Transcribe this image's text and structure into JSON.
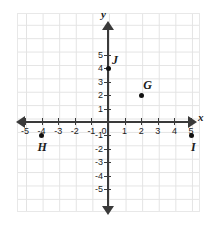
{
  "chart_data": {
    "type": "scatter",
    "title": "",
    "xlabel": "x",
    "ylabel": "y",
    "xlim": [
      -5.5,
      5.5
    ],
    "ylim": [
      -5.5,
      5.5
    ],
    "grid": true,
    "legend": "none",
    "x_ticks": [
      "-5",
      "-4",
      "-3",
      "-2",
      "-1",
      "0",
      "1",
      "2",
      "3",
      "4",
      "5"
    ],
    "y_ticks": [
      "5",
      "4",
      "3",
      "2",
      "1",
      "-1",
      "-2",
      "-3",
      "-4",
      "-5"
    ],
    "origin_label": "0",
    "points": [
      {
        "label": "G",
        "x": 2,
        "y": 2
      },
      {
        "label": "H",
        "x": -4,
        "y": -1
      },
      {
        "label": "I",
        "x": 5,
        "y": -1
      },
      {
        "label": "J",
        "x": 0,
        "y": 4
      }
    ],
    "colors": {
      "grid": "#e3e3e3",
      "axis": "#3a3a3a",
      "point": "#111111",
      "text": "#1b1b1b",
      "background": "#ffffff"
    }
  },
  "axes": {
    "x_name": "x",
    "y_name": "y"
  },
  "x_tick_labels": [
    {
      "text": "-5",
      "value": -5
    },
    {
      "text": "-4",
      "value": -4
    },
    {
      "text": "-3",
      "value": -3
    },
    {
      "text": "-2",
      "value": -2
    },
    {
      "text": "-1",
      "value": -1
    },
    {
      "text": "0",
      "value": 0
    },
    {
      "text": "1",
      "value": 1
    },
    {
      "text": "2",
      "value": 2
    },
    {
      "text": "3",
      "value": 3
    },
    {
      "text": "4",
      "value": 4
    },
    {
      "text": "5",
      "value": 5
    }
  ],
  "y_tick_labels": [
    {
      "text": "5",
      "value": 5
    },
    {
      "text": "4",
      "value": 4
    },
    {
      "text": "3",
      "value": 3
    },
    {
      "text": "2",
      "value": 2
    },
    {
      "text": "1",
      "value": 1
    },
    {
      "text": "-1",
      "value": -1
    },
    {
      "text": "-2",
      "value": -2
    },
    {
      "text": "-3",
      "value": -3
    },
    {
      "text": "-4",
      "value": -4
    },
    {
      "text": "-5",
      "value": -5
    }
  ],
  "point_labels": {
    "g": "G",
    "h": "H",
    "i": "I",
    "j": "J"
  }
}
